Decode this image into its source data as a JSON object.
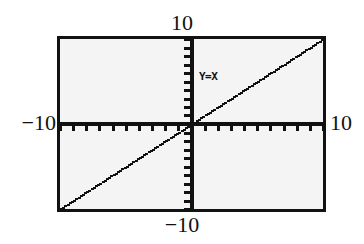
{
  "figure": {
    "name": "graphing-calculator-screen",
    "background_color": "#ffffff",
    "screen_color": "#f4f4f4",
    "frame_color": "#121212",
    "ink_color": "#111111"
  },
  "labels": {
    "top": "10",
    "bottom": "−10",
    "left": "−10",
    "right": "10"
  },
  "annotation": {
    "equation": "Y=X"
  },
  "chart_data": {
    "type": "line",
    "title": "",
    "subtitle": "",
    "xlabel": "",
    "ylabel": "",
    "xlim": [
      -10,
      10
    ],
    "ylim": [
      -10,
      10
    ],
    "grid": false,
    "legend": false,
    "legend_position": "none",
    "x_tick_labels": [
      "−10",
      "10"
    ],
    "y_tick_labels": [
      "−10",
      "10"
    ],
    "x_tick_interval": 1,
    "y_tick_interval": 1,
    "axes_style": "crosshair-with-tickmarks",
    "line_style": "pixelated-dotted",
    "annotations": [
      {
        "text": "Y=X",
        "x": 1.6,
        "y": 5.6
      }
    ],
    "series": [
      {
        "name": "Y=X",
        "equation": "y = x",
        "slope": 1,
        "intercept": 0,
        "x": [
          -10,
          -9,
          -8,
          -7,
          -6,
          -5,
          -4,
          -3,
          -2,
          -1,
          0,
          1,
          2,
          3,
          4,
          5,
          6,
          7,
          8,
          9,
          10
        ],
        "values": [
          -10,
          -9,
          -8,
          -7,
          -6,
          -5,
          -4,
          -3,
          -2,
          -1,
          0,
          1,
          2,
          3,
          4,
          5,
          6,
          7,
          8,
          9,
          10
        ]
      }
    ]
  }
}
